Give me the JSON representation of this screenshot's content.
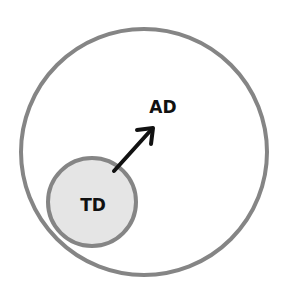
{
  "diagram": {
    "outer": {
      "label": "AD",
      "cx": 144,
      "cy": 152,
      "r": 123,
      "stroke": "#858585",
      "fill": "#ffffff"
    },
    "inner": {
      "label": "TD",
      "cx": 92,
      "cy": 202,
      "r": 44,
      "stroke": "#858585",
      "fill": "#e5e5e5"
    },
    "arrow": {
      "from": [
        114,
        171
      ],
      "to": [
        153,
        128
      ],
      "color": "#111111"
    }
  }
}
